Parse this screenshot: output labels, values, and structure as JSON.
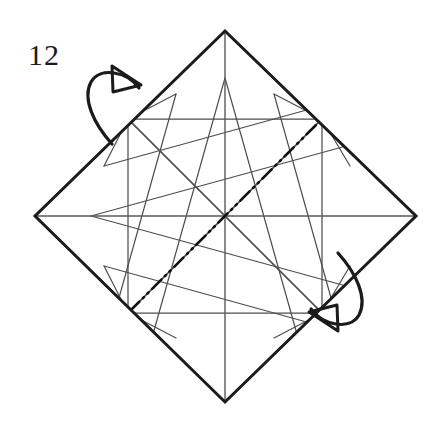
{
  "figure": {
    "kind": "origami-crease-pattern-diagram",
    "step_number": "12",
    "caption": "",
    "background_color": "#ffffff",
    "ink_color": "#1b1b1b",
    "crease_color": "#3a3a3a"
  },
  "colors": {
    "paper_edge": "#1b1b1b",
    "valley_crease": "#4a4a4a",
    "mountain_crease": "#111111",
    "axis_crease": "#5a5a5a",
    "arrow": "#1b1b1b",
    "paper_fill": "#ffffff"
  },
  "geometry": {
    "center": {
      "x": 225,
      "y": 216
    },
    "square_vertices": {
      "top": {
        "x": 225,
        "y": 31
      },
      "right": {
        "x": 416,
        "y": 216
      },
      "bottom": {
        "x": 225,
        "y": 402
      },
      "left": {
        "x": 35,
        "y": 216
      }
    },
    "inner_square_half_size": 97,
    "octagon_radius": 131
  },
  "creases": {
    "axes": [
      {
        "name": "horizontal-axis",
        "type": "valley",
        "x1": 35,
        "y1": 216,
        "x2": 416,
        "y2": 216
      },
      {
        "name": "vertical-axis",
        "type": "valley",
        "x1": 225,
        "y1": 31,
        "x2": 225,
        "y2": 402
      }
    ],
    "inner_square": [
      {
        "name": "inner-square-top",
        "x1": 128,
        "y1": 119,
        "x2": 322,
        "y2": 119
      },
      {
        "name": "inner-square-right",
        "x1": 322,
        "y1": 119,
        "x2": 322,
        "y2": 313
      },
      {
        "name": "inner-square-bottom",
        "x1": 322,
        "y1": 313,
        "x2": 128,
        "y2": 313
      },
      {
        "name": "inner-square-left",
        "x1": 128,
        "y1": 313,
        "x2": 128,
        "y2": 119
      }
    ],
    "star_rays": [
      {
        "name": "ray-nw",
        "x1": 225,
        "y1": 216,
        "x2": 128,
        "y2": 119
      },
      {
        "name": "ray-ne",
        "x1": 225,
        "y1": 216,
        "x2": 322,
        "y2": 119
      },
      {
        "name": "ray-se",
        "x1": 225,
        "y1": 216,
        "x2": 322,
        "y2": 313
      },
      {
        "name": "ray-sw",
        "x1": 225,
        "y1": 216,
        "x2": 128,
        "y2": 313
      }
    ],
    "mountain_diagonal": {
      "name": "mountain-fold-diagonal-ne-sw",
      "type": "mountain",
      "pattern": "dash-dot-dot",
      "x1": 110,
      "y1": 331,
      "x2": 340,
      "y2": 101
    },
    "long_diagonals": [
      {
        "name": "crease-long-a",
        "x1": 128,
        "y1": 119,
        "x2": 322,
        "y2": 313
      },
      {
        "name": "crease-long-b",
        "x1": 322,
        "y1": 119,
        "x2": 128,
        "y2": 313
      }
    ]
  },
  "arrows": [
    {
      "name": "fold-arrow-top-left",
      "label": "turn-over-arrow",
      "direction": "up-right",
      "position": {
        "x": 90,
        "y": 62
      },
      "description": "curved fold-over arrow with hollow triangular head"
    },
    {
      "name": "fold-arrow-bottom-right",
      "label": "turn-over-arrow",
      "direction": "down-left",
      "position": {
        "x": 300,
        "y": 292
      },
      "description": "curved fold-over arrow with hollow triangular head, rotated 180 degrees"
    }
  ],
  "legend": {
    "valley_line_style": "solid thin",
    "mountain_line_style": "dash-dot-dot",
    "paper_edge_style": "solid thick"
  }
}
